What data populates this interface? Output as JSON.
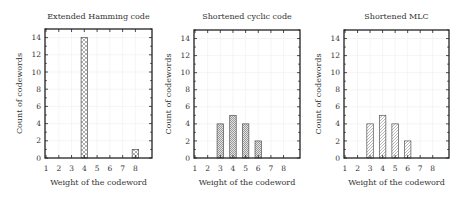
{
  "chart_data": [
    {
      "type": "bar",
      "title": "Extended Hamming code",
      "xlabel": "Weight of the codeword",
      "ylabel": "Count of codewords",
      "categories": [
        1,
        2,
        3,
        4,
        5,
        6,
        7,
        8
      ],
      "values": [
        0,
        0,
        0,
        14,
        0,
        0,
        0,
        1
      ],
      "ylim": [
        0,
        15
      ],
      "yticks": [
        0,
        2,
        4,
        6,
        8,
        10,
        12,
        14
      ],
      "xticks": [
        1,
        2,
        3,
        4,
        5,
        6,
        7,
        8
      ],
      "grid": true,
      "pattern": "crosshatch",
      "frame": {
        "left": 45,
        "top": 29,
        "right": 152,
        "bottom": 158
      }
    },
    {
      "type": "bar",
      "title": "Shortened cyclic code",
      "xlabel": "Weight of the codeword",
      "ylabel": "Count of codewords",
      "categories": [
        1,
        2,
        3,
        4,
        5,
        6,
        7,
        8
      ],
      "values": [
        0,
        0,
        4,
        5,
        4,
        2,
        0,
        0
      ],
      "ylim": [
        0,
        15
      ],
      "yticks": [
        0,
        2,
        4,
        6,
        8,
        10,
        12,
        14
      ],
      "xticks": [
        1,
        2,
        3,
        4,
        5,
        6,
        7,
        8
      ],
      "grid": true,
      "pattern": "dots",
      "frame": {
        "left": 194,
        "top": 30,
        "right": 300,
        "bottom": 158
      }
    },
    {
      "type": "bar",
      "title": "Shortened MLC",
      "xlabel": "Weight of the codeword",
      "ylabel": "Count of codewords",
      "categories": [
        1,
        2,
        3,
        4,
        5,
        6,
        7,
        8
      ],
      "values": [
        0,
        0,
        4,
        5,
        4,
        2,
        0,
        0
      ],
      "ylim": [
        0,
        15
      ],
      "yticks": [
        0,
        2,
        4,
        6,
        8,
        10,
        12,
        14
      ],
      "xticks": [
        1,
        2,
        3,
        4,
        5,
        6,
        7,
        8
      ],
      "grid": true,
      "pattern": "diagonal",
      "frame": {
        "left": 344,
        "top": 30,
        "right": 449,
        "bottom": 158
      }
    }
  ],
  "colors": {
    "frame": "#222222",
    "bar_edge": "#555555",
    "grid": "#eeeeee",
    "text": "#333333"
  }
}
